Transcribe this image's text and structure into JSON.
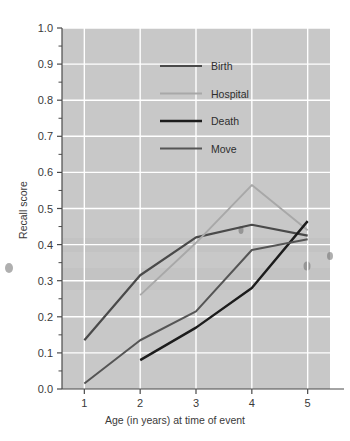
{
  "chart_data": {
    "type": "line",
    "title": "",
    "xlabel": "Age (in years) at time of event",
    "ylabel": "Recall score",
    "x": [
      1,
      2,
      3,
      4,
      5
    ],
    "xlim": [
      0.6,
      5.4
    ],
    "ylim": [
      0.0,
      1.0
    ],
    "grid": true,
    "legend_position": "upper center",
    "xtick_labels": [
      "1",
      "2",
      "3",
      "4",
      "5"
    ],
    "ytick_labels": [
      "0.0",
      "0.1",
      "0.2",
      "0.3",
      "0.4",
      "0.5",
      "0.6",
      "0.7",
      "0.8",
      "0.9",
      "1.0"
    ],
    "ytick_values": [
      0.0,
      0.1,
      0.2,
      0.3,
      0.4,
      0.5,
      0.6,
      0.7,
      0.8,
      0.9,
      1.0
    ],
    "yminor_step": 0.05,
    "series": [
      {
        "name": "Birth",
        "color": "#4a4a4a",
        "x": [
          1,
          2,
          3,
          4,
          5
        ],
        "values": [
          0.135,
          0.315,
          0.42,
          0.455,
          0.425
        ]
      },
      {
        "name": "Hospital",
        "color": "#a8a8a8",
        "x": [
          2,
          3,
          4,
          5
        ],
        "values": [
          0.26,
          0.405,
          0.565,
          0.44
        ]
      },
      {
        "name": "Death",
        "color": "#1c1c1c",
        "x": [
          2,
          3,
          4,
          5
        ],
        "values": [
          0.08,
          0.17,
          0.28,
          0.465
        ]
      },
      {
        "name": "Move",
        "color": "#555555",
        "x": [
          1,
          2,
          3,
          4,
          5
        ],
        "values": [
          0.015,
          0.135,
          0.215,
          0.385,
          0.415
        ]
      }
    ]
  },
  "legend": {
    "entries": [
      {
        "label": "Birth"
      },
      {
        "label": "Hospital"
      },
      {
        "label": "Death"
      },
      {
        "label": "Move"
      }
    ]
  },
  "axes": {
    "y_title": "Recall score",
    "x_title": "Age (in years) at time of event"
  },
  "colors": {
    "plot_background": "#c8c8c8",
    "gridline": "#ffffff",
    "axis": "#4a4a4a",
    "page_background": "#ffffff"
  }
}
